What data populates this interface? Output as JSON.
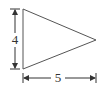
{
  "diagram": {
    "shape": "triangle",
    "vertices": [
      [
        23,
        9
      ],
      [
        23,
        69
      ],
      [
        96,
        40
      ]
    ],
    "stroke_color": "#555555",
    "dimensions": {
      "height": {
        "label": "4",
        "orientation": "vertical"
      },
      "base": {
        "label": "5",
        "orientation": "horizontal"
      }
    }
  }
}
